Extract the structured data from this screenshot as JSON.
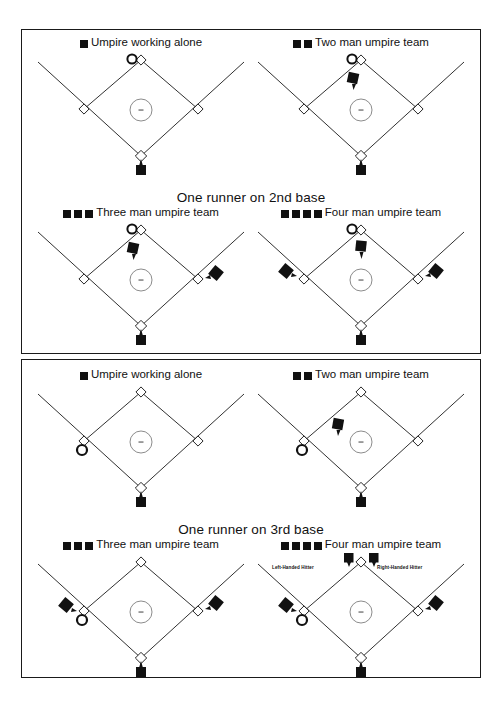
{
  "figure": {
    "panels": [
      {
        "id": "runner-on-2nd",
        "caption": "One runner on 2nd base",
        "runner_base": "2nd",
        "cells": [
          {
            "id": "alone-2nd",
            "label": "Umpire working alone",
            "legend_squares": 1,
            "umpires": [
              "plate"
            ],
            "runner": "second"
          },
          {
            "id": "two-man-2nd",
            "label": "Two man umpire team",
            "legend_squares": 2,
            "umpires": [
              "plate",
              "infield-left-of-mound"
            ],
            "runner": "second"
          },
          {
            "id": "three-man-2nd",
            "label": "Three man umpire team",
            "legend_squares": 3,
            "umpires": [
              "plate",
              "infield-left-of-mound",
              "outside-first"
            ],
            "runner": "second"
          },
          {
            "id": "four-man-2nd",
            "label": "Four man umpire team",
            "legend_squares": 4,
            "umpires": [
              "plate",
              "infield-left-of-mound",
              "outside-first",
              "outside-third"
            ],
            "runner": "second"
          }
        ]
      },
      {
        "id": "runner-on-3rd",
        "caption": "One runner on 3rd base",
        "runner_base": "3rd",
        "cells": [
          {
            "id": "alone-3rd",
            "label": "Umpire working alone",
            "legend_squares": 1,
            "umpires": [
              "plate"
            ],
            "runner": "third"
          },
          {
            "id": "two-man-3rd",
            "label": "Two man umpire team",
            "legend_squares": 2,
            "umpires": [
              "plate",
              "infield-left-of-mound"
            ],
            "runner": "third"
          },
          {
            "id": "three-man-3rd",
            "label": "Three man umpire team",
            "legend_squares": 3,
            "umpires": [
              "plate",
              "outside-third",
              "outside-first"
            ],
            "runner": "third"
          },
          {
            "id": "four-man-3rd",
            "label": "Four man umpire team",
            "legend_squares": 4,
            "umpires": [
              "plate",
              "outside-third",
              "outside-first",
              "second-left",
              "second-right"
            ],
            "runner": "third",
            "hitter_labels": {
              "left": "Left-Handed Hitter",
              "right": "Right-Handed Hitter"
            }
          }
        ]
      }
    ]
  }
}
